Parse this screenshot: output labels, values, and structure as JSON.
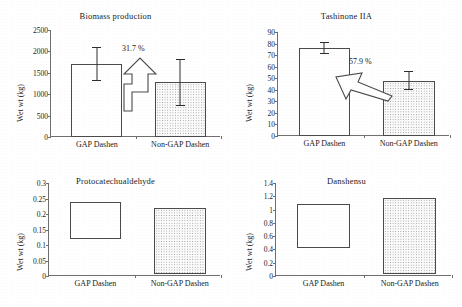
{
  "figure": {
    "background": "#ffffff",
    "axis_color": "#6f6f6f",
    "bar_outline": "#4a4a4a",
    "series_names": [
      "GAP Dashen",
      "Non-GAP Dashen"
    ]
  },
  "chart_data": [
    {
      "type": "bar",
      "title": "Biomass production",
      "xlabel": "",
      "ylabel": "Wet wt (kg)",
      "categories": [
        "GAP Dashen",
        "Non-GAP Dashen"
      ],
      "values": [
        1700,
        1280
      ],
      "errors": [
        400,
        550
      ],
      "error_low": [
        1300,
        730
      ],
      "error_high": [
        2100,
        1830
      ],
      "ylim": [
        0,
        2500
      ],
      "yticks": [
        0,
        500,
        1000,
        1500,
        2000,
        2500
      ],
      "ytick_labels": [
        "0",
        "500",
        "1000",
        "1500",
        "2000",
        "2500"
      ],
      "grid": false,
      "legend": "none",
      "annotation": {
        "text": "31.7 %",
        "arrow": "bent-up-arrow",
        "direction": "up",
        "from": "Non-GAP Dashen",
        "to": "GAP Dashen"
      },
      "bar_styles": [
        "open",
        "dotted"
      ]
    },
    {
      "type": "bar",
      "title": "Tashinone IIA",
      "xlabel": "",
      "ylabel": "Wet wt (kg)",
      "categories": [
        "GAP Dashen",
        "Non-GAP Dashen"
      ],
      "values": [
        76,
        48
      ],
      "errors": [
        5,
        8
      ],
      "error_low": [
        71,
        40
      ],
      "error_high": [
        81,
        56
      ],
      "ylim": [
        0,
        90
      ],
      "yticks": [
        0,
        10,
        20,
        30,
        40,
        50,
        60,
        70,
        80,
        90
      ],
      "ytick_labels": [
        "0",
        "10",
        "20",
        "30",
        "40",
        "50",
        "60",
        "70",
        "80",
        "90"
      ],
      "grid": false,
      "legend": "none",
      "annotation": {
        "text": "57.9 %",
        "arrow": "diagonal-left-arrow",
        "direction": "left",
        "from": "Non-GAP Dashen",
        "to": "GAP Dashen"
      },
      "bar_styles": [
        "open",
        "dotted"
      ]
    },
    {
      "type": "bar",
      "title": "Protocatechualdehyde",
      "xlabel": "",
      "ylabel": "Wet wt (kg)",
      "categories": [
        "GAP Dashen",
        "Non-GAP Dashen"
      ],
      "values": [
        0.24,
        0.218
      ],
      "value_base": [
        0.12,
        0.007
      ],
      "ylim": [
        0,
        0.3
      ],
      "yticks": [
        0,
        0.05,
        0.1,
        0.15,
        0.2,
        0.25,
        0.3
      ],
      "ytick_labels": [
        "0",
        "0.05",
        "0.1",
        "0.15",
        "0.2",
        "0.25",
        "0.3"
      ],
      "grid": false,
      "legend": "none",
      "bar_styles": [
        "open",
        "dotted"
      ]
    },
    {
      "type": "bar",
      "title": "Danshensu",
      "xlabel": "",
      "ylabel": "Wet wt (kg)",
      "categories": [
        "GAP Dashen",
        "Non-GAP Dashen"
      ],
      "values": [
        1.09,
        1.18
      ],
      "value_base": [
        0.42,
        0.03
      ],
      "ylim": [
        0,
        1.4
      ],
      "yticks": [
        0,
        0.2,
        0.4,
        0.6,
        0.8,
        1.0,
        1.2,
        1.4
      ],
      "ytick_labels": [
        "0",
        "0.2",
        "0.4",
        "0.6",
        "0.8",
        "1",
        "1.2",
        "1.4"
      ],
      "grid": false,
      "legend": "none",
      "bar_styles": [
        "open",
        "dotted"
      ]
    }
  ]
}
